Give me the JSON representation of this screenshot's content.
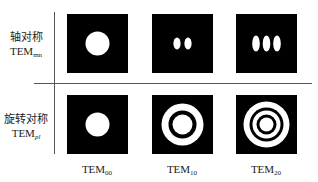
{
  "rows": [
    {
      "label_cn": "轴对称",
      "label_tem": "TEM",
      "label_sub": "mn",
      "sub_italic": false
    },
    {
      "label_cn": "旋转对称",
      "label_tem": "TEM",
      "label_sub": "pl",
      "sub_italic": true
    }
  ],
  "columns": [
    {
      "label": "TEM",
      "sub": "00"
    },
    {
      "label": "TEM",
      "sub": "10"
    },
    {
      "label": "TEM",
      "sub": "20"
    }
  ],
  "panels": {
    "axial": [
      "single spot",
      "two spots",
      "three spots"
    ],
    "rotational": [
      "single spot",
      "spot with one ring",
      "spot with two rings"
    ]
  },
  "colors": {
    "background": "#000000",
    "beam": "#ffffff",
    "lines": "#555555"
  }
}
